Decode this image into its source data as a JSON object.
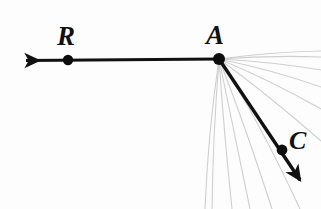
{
  "figure": {
    "background_color": "#fdfdfd",
    "ink_color": "#111111",
    "faint_ray_color": "#cfcfcf",
    "width": 321,
    "height": 209
  },
  "labels": {
    "point_r": "R",
    "point_a": "A",
    "point_c": "C",
    "edge_fragment": ""
  },
  "points": [
    {
      "name": "R",
      "x": 68,
      "y": 60
    },
    {
      "name": "A",
      "x": 219,
      "y": 59
    },
    {
      "name": "C",
      "x": 282,
      "y": 150
    }
  ],
  "rays": [
    {
      "name": "ray-AR",
      "from": "A",
      "through": "R",
      "start": {
        "x": 219,
        "y": 59
      },
      "end": {
        "x": 20,
        "y": 60
      },
      "arrow_at_end": true,
      "stroke_width": 3.2
    },
    {
      "name": "ray-AC",
      "from": "A",
      "through": "C",
      "start": {
        "x": 219,
        "y": 59
      },
      "end": {
        "x": 307,
        "y": 190
      },
      "arrow_at_end": true,
      "stroke_width": 3.4
    }
  ],
  "faint_rays": {
    "origin": {
      "x": 219,
      "y": 59
    },
    "description": "faint gray pencil fan of rays spreading clockwise from horizontal-right to vertical-down",
    "endpoints": [
      {
        "x": 321,
        "y": 52
      },
      {
        "x": 321,
        "y": 58
      },
      {
        "x": 321,
        "y": 70
      },
      {
        "x": 321,
        "y": 86
      },
      {
        "x": 321,
        "y": 108
      },
      {
        "x": 321,
        "y": 140
      },
      {
        "x": 300,
        "y": 209
      },
      {
        "x": 272,
        "y": 209
      },
      {
        "x": 250,
        "y": 209
      },
      {
        "x": 232,
        "y": 209
      },
      {
        "x": 212,
        "y": 209
      },
      {
        "x": 205,
        "y": 209
      }
    ]
  }
}
